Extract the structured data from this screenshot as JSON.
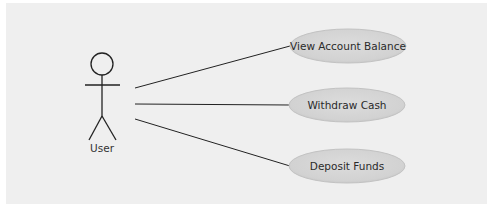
{
  "diagram": {
    "type": "use-case",
    "actor": {
      "label": "User"
    },
    "use_cases": [
      {
        "label": "View Account Balance"
      },
      {
        "label": "Withdraw Cash"
      },
      {
        "label": "Deposit Funds"
      }
    ],
    "colors": {
      "background": "#efefef",
      "use_case_fill": "#d4d4d4",
      "use_case_stroke": "#c2c2c2",
      "line": "#222222"
    }
  }
}
